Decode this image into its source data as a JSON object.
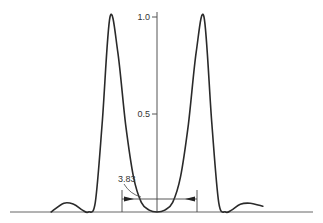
{
  "figure": {
    "type": "line-diagram",
    "axis": {
      "tick_labels": [
        {
          "value": 1.0,
          "label": "1.0"
        },
        {
          "value": 0.5,
          "label": "0.5"
        }
      ]
    },
    "dimension": {
      "label": "3.83"
    },
    "colors": {
      "curve": "#2a2a2a",
      "axis": "#555555",
      "baseline": "#666666"
    }
  },
  "chart_data": {
    "type": "line",
    "title": "",
    "xlabel": "",
    "ylabel": "",
    "ylim": [
      0,
      1.0
    ],
    "y_ticks": [
      0.5,
      1.0
    ],
    "annotations": [
      {
        "text": "3.83",
        "type": "dimension-width",
        "target": "central minimum"
      }
    ],
    "series": [
      {
        "name": "intensity",
        "x": [
          -10.8,
          -9.5,
          -8.5,
          -7.6,
          -7.0,
          -6.3,
          -5.6,
          -4.8,
          -4.0,
          -3.2,
          -2.4,
          -1.6,
          -0.8,
          0,
          0.8,
          1.6,
          2.4,
          3.2,
          4.0,
          4.8,
          5.6,
          6.3,
          7.0,
          7.6,
          8.5,
          9.5,
          10.8
        ],
        "y": [
          0.0,
          0.045,
          0.04,
          0.01,
          0.0,
          0.05,
          0.45,
          1.0,
          0.82,
          0.45,
          0.18,
          0.05,
          0.01,
          0.0,
          0.01,
          0.05,
          0.18,
          0.45,
          0.82,
          1.0,
          0.45,
          0.05,
          0.0,
          0.01,
          0.04,
          0.045,
          0.03
        ]
      }
    ],
    "grid": false,
    "legend": null
  }
}
